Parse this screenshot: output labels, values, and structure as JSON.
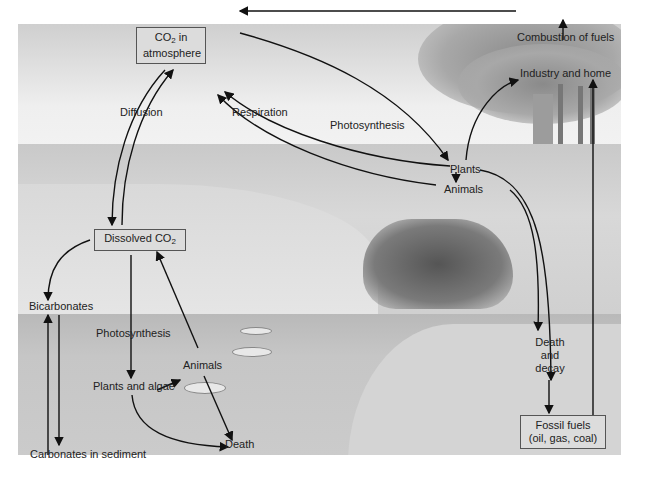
{
  "diagram": {
    "nodes": {
      "co2_atmosphere": {
        "line1_pre": "CO",
        "line1_sub": "2",
        "line1_post": " in",
        "line2": "atmosphere"
      },
      "combustion": "Combustion of fuels",
      "industry": "Industry and home",
      "diffusion": "Diffusion",
      "respiration": "Respiration",
      "photosynthesis_top": "Photosynthesis",
      "plants": "Plants",
      "animals_land": "Animals",
      "dissolved_co2": {
        "pre": "Dissolved CO",
        "sub": "2"
      },
      "bicarbonates": "Bicarbonates",
      "photosynthesis_water": "Photosynthesis",
      "animals_water": "Animals",
      "plants_algae": "Plants and algae",
      "death": "Death",
      "carbonates": "Carbonates in sediment",
      "death_decay": {
        "line1": "Death",
        "line2": "and",
        "line3": "decay"
      },
      "fossil_fuels": {
        "line1": "Fossil fuels",
        "line2": "(oil, gas, coal)"
      }
    },
    "edges": [
      {
        "from": "Combustion of fuels",
        "to": "CO2 in atmosphere"
      },
      {
        "from": "Industry and home",
        "to": "Combustion of fuels"
      },
      {
        "from": "Plants",
        "to": "Industry and home"
      },
      {
        "from": "Fossil fuels",
        "to": "Industry and home"
      },
      {
        "from": "CO2 in atmosphere",
        "to": "Plants",
        "label": "Photosynthesis"
      },
      {
        "from": "Plants",
        "to": "CO2 in atmosphere",
        "label": "Respiration"
      },
      {
        "from": "Animals",
        "to": "CO2 in atmosphere",
        "label": "Respiration"
      },
      {
        "from": "Plants",
        "to": "Animals"
      },
      {
        "from": "Plants",
        "to": "Death and decay"
      },
      {
        "from": "Animals",
        "to": "Death and decay"
      },
      {
        "from": "Death and decay",
        "to": "Fossil fuels"
      },
      {
        "from": "CO2 in atmosphere",
        "to": "Dissolved CO2",
        "label": "Diffusion"
      },
      {
        "from": "Dissolved CO2",
        "to": "CO2 in atmosphere",
        "label": "Diffusion"
      },
      {
        "from": "Dissolved CO2",
        "to": "Bicarbonates"
      },
      {
        "from": "Bicarbonates",
        "to": "Dissolved CO2"
      },
      {
        "from": "Bicarbonates",
        "to": "Carbonates in sediment"
      },
      {
        "from": "Carbonates in sediment",
        "to": "Bicarbonates"
      },
      {
        "from": "Dissolved CO2",
        "to": "Plants and algae",
        "label": "Photosynthesis"
      },
      {
        "from": "Plants and algae",
        "to": "Animals"
      },
      {
        "from": "Animals",
        "to": "Dissolved CO2"
      },
      {
        "from": "Animals",
        "to": "Death"
      },
      {
        "from": "Plants and algae",
        "to": "Death"
      }
    ],
    "colors": {
      "arrow": "#111111",
      "box_border": "#555555",
      "text": "#222222"
    }
  }
}
